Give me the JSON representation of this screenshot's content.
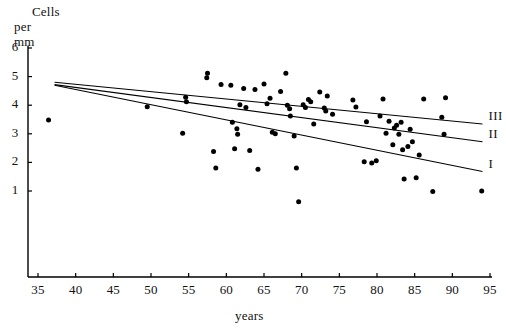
{
  "chart_data": {
    "type": "scatter",
    "title": "",
    "ylabel_line1": "Cells",
    "ylabel_line2": "per mm",
    "xlabel": "years",
    "xlim": [
      35,
      95
    ],
    "ylim": [
      0,
      6
    ],
    "xticks": [
      35,
      40,
      45,
      50,
      55,
      60,
      65,
      70,
      75,
      80,
      85,
      90,
      95
    ],
    "yticks": [
      1,
      2,
      3,
      4,
      5,
      6
    ],
    "grid": false,
    "legend_position": "right-inline",
    "point_color": "#000000",
    "line_color": "#000000",
    "axis_color": "#000000",
    "points": [
      [
        36.4,
        3.48
      ],
      [
        49.5,
        3.95
      ],
      [
        54.2,
        3.02
      ],
      [
        54.6,
        4.28
      ],
      [
        54.7,
        4.12
      ],
      [
        57.4,
        4.96
      ],
      [
        57.5,
        5.12
      ],
      [
        58.3,
        2.38
      ],
      [
        58.6,
        1.8
      ],
      [
        59.3,
        4.72
      ],
      [
        60.6,
        4.7
      ],
      [
        60.8,
        3.4
      ],
      [
        61.1,
        2.48
      ],
      [
        61.4,
        3.18
      ],
      [
        61.5,
        2.98
      ],
      [
        61.8,
        4.02
      ],
      [
        62.3,
        4.58
      ],
      [
        62.6,
        3.92
      ],
      [
        63.1,
        2.42
      ],
      [
        63.8,
        4.55
      ],
      [
        64.2,
        1.76
      ],
      [
        65.0,
        4.74
      ],
      [
        65.4,
        4.05
      ],
      [
        65.8,
        4.24
      ],
      [
        66.1,
        3.05
      ],
      [
        66.5,
        3.0
      ],
      [
        67.2,
        4.48
      ],
      [
        67.9,
        5.12
      ],
      [
        68.1,
        4.0
      ],
      [
        68.4,
        3.88
      ],
      [
        68.5,
        3.62
      ],
      [
        69.0,
        2.92
      ],
      [
        69.3,
        1.8
      ],
      [
        69.6,
        0.62
      ],
      [
        70.2,
        4.02
      ],
      [
        70.5,
        3.92
      ],
      [
        70.9,
        4.2
      ],
      [
        71.2,
        4.12
      ],
      [
        71.6,
        3.34
      ],
      [
        72.4,
        4.46
      ],
      [
        73.0,
        3.9
      ],
      [
        73.2,
        3.8
      ],
      [
        73.4,
        4.32
      ],
      [
        74.1,
        3.68
      ],
      [
        76.8,
        4.18
      ],
      [
        77.2,
        3.94
      ],
      [
        78.3,
        2.02
      ],
      [
        78.6,
        3.42
      ],
      [
        79.3,
        1.98
      ],
      [
        79.9,
        2.06
      ],
      [
        80.4,
        3.62
      ],
      [
        80.8,
        4.22
      ],
      [
        81.2,
        3.02
      ],
      [
        81.6,
        3.44
      ],
      [
        82.1,
        2.62
      ],
      [
        82.3,
        3.2
      ],
      [
        82.6,
        3.3
      ],
      [
        82.9,
        2.98
      ],
      [
        83.2,
        3.4
      ],
      [
        83.4,
        2.44
      ],
      [
        83.6,
        1.42
      ],
      [
        84.1,
        2.56
      ],
      [
        84.4,
        3.16
      ],
      [
        84.7,
        2.72
      ],
      [
        85.2,
        1.46
      ],
      [
        85.6,
        2.26
      ],
      [
        86.2,
        4.22
      ],
      [
        87.4,
        0.98
      ],
      [
        88.6,
        3.58
      ],
      [
        88.9,
        2.98
      ],
      [
        89.1,
        4.26
      ],
      [
        93.9,
        1.0
      ]
    ],
    "lines": [
      {
        "label": "III",
        "x1": 37.2,
        "y1": 4.8,
        "x2": 94.0,
        "y2": 3.34
      },
      {
        "label": "II",
        "x1": 37.2,
        "y1": 4.72,
        "x2": 94.0,
        "y2": 2.72
      },
      {
        "label": "I",
        "x1": 37.2,
        "y1": 4.7,
        "x2": 94.0,
        "y2": 1.68
      }
    ]
  }
}
